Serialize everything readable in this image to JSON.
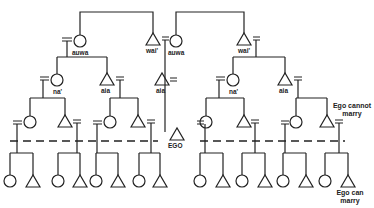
{
  "diagram": {
    "type": "kinship-chart",
    "colors": {
      "line": "#222222",
      "background": "#ffffff"
    },
    "labels": {
      "auwa_left": "auwa",
      "wai_left": "wai'",
      "auwa_right": "auwa",
      "wai_right": "wai'",
      "na_left": "na'",
      "aia_left": "aia",
      "aia_middle": "aia",
      "na_right": "na'",
      "aia_right": "aia",
      "ego": "EGO",
      "ego_cannot_marry_1": "Ego  cannot",
      "ego_cannot_marry_2": "marry",
      "ego_can_marry_1": "Ego  can",
      "ego_can_marry_2": "marry"
    },
    "legend": {
      "circle": "female",
      "triangle": "male",
      "double_bar": "marriage",
      "dashed_line": "marriage boundary"
    }
  }
}
